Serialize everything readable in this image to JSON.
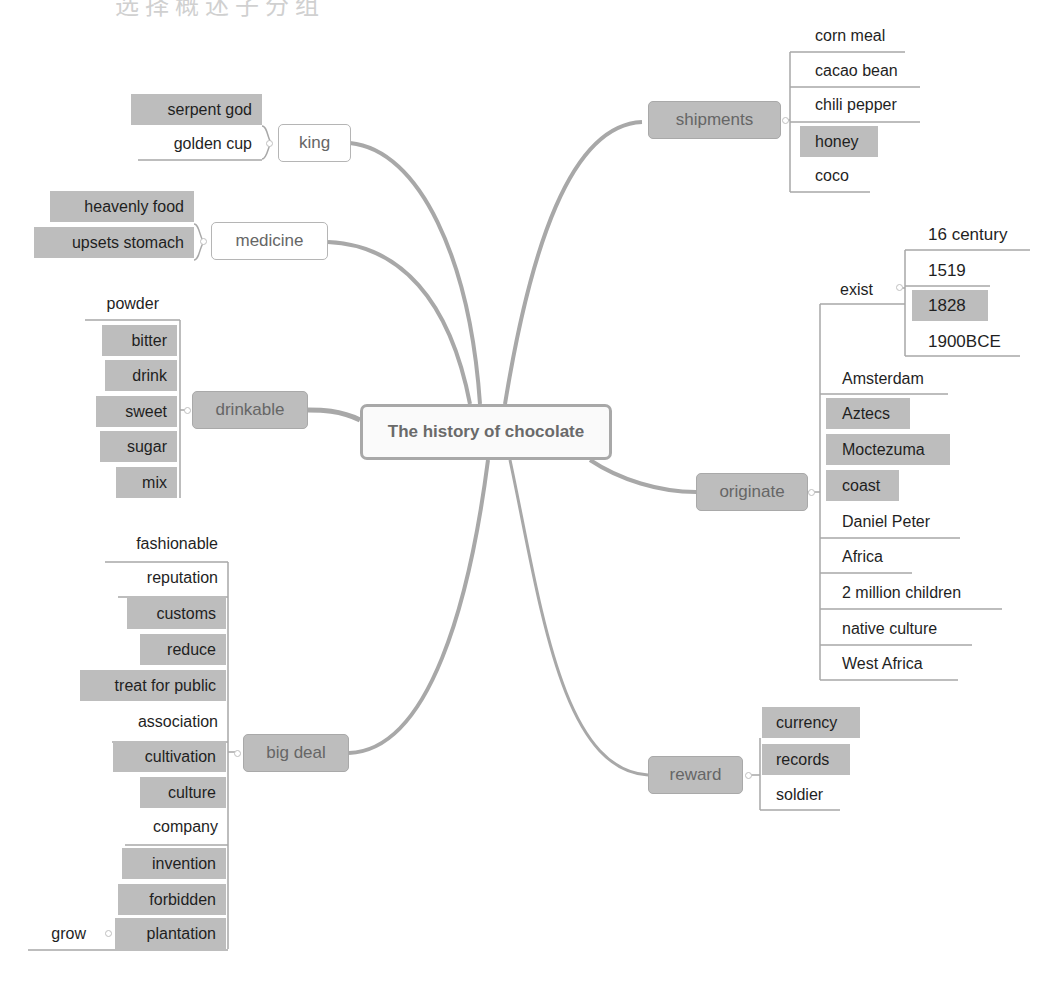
{
  "top_text": "选择概述子分组",
  "mindmap": {
    "root": "The history of chocolate",
    "colors": {
      "line": "#a8a8a8",
      "filled": "#bdbdbd",
      "plain": "#ffffff",
      "topic_text": "#666666",
      "leaf_text": "#1f1f1f"
    },
    "branches": {
      "king": {
        "label": "king",
        "children": [
          "serpent god",
          "golden cup"
        ]
      },
      "medicine": {
        "label": "medicine",
        "children": [
          "heavenly food",
          "upsets stomach"
        ]
      },
      "drinkable": {
        "label": "drinkable",
        "children": [
          "powder",
          "bitter",
          "drink",
          "sweet",
          "sugar",
          "mix"
        ]
      },
      "big_deal": {
        "label": "big deal",
        "children": [
          "fashionable",
          "reputation",
          "customs",
          "reduce",
          "treat for public",
          "association",
          "cultivation",
          "culture",
          "company",
          "invention",
          "forbidden",
          "plantation"
        ],
        "sub": {
          "plantation": [
            "grow"
          ]
        }
      },
      "shipments": {
        "label": "shipments",
        "children": [
          "corn meal",
          "cacao bean",
          "chili pepper",
          "honey",
          "coco"
        ]
      },
      "originate": {
        "label": "originate",
        "children": [
          "exist",
          "Amsterdam",
          "Aztecs",
          "Moctezuma",
          "coast",
          "Daniel Peter",
          "Africa",
          "2 million children",
          "native culture",
          "West Africa"
        ],
        "sub": {
          "exist": [
            "16 century",
            "1519",
            "1828",
            "1900BCE"
          ]
        }
      },
      "reward": {
        "label": "reward",
        "children": [
          "currency",
          "records",
          "soldier"
        ]
      }
    }
  }
}
